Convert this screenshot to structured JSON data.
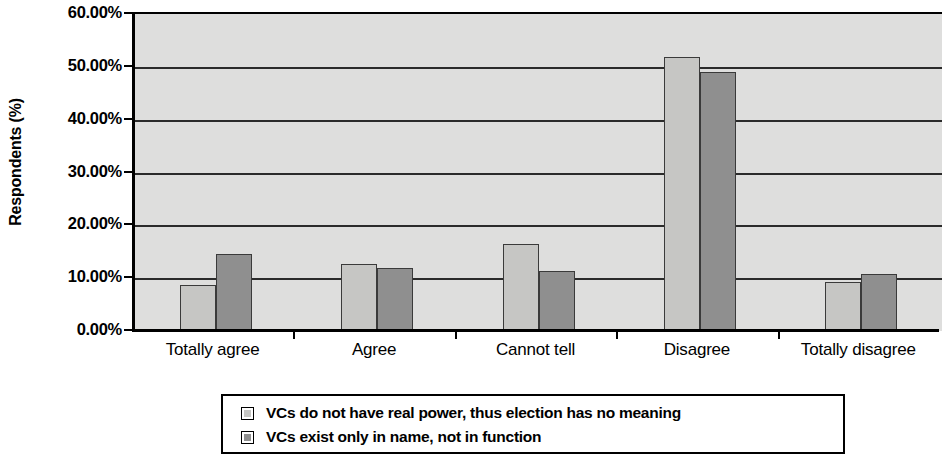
{
  "chart_data": {
    "type": "bar",
    "title": "",
    "xlabel": "",
    "ylabel": "Respondents (%)",
    "categories": [
      "Totally agree",
      "Agree",
      "Cannot tell",
      "Disagree",
      "Totally disagree"
    ],
    "series": [
      {
        "name": "VCs do not have real power, thus election has no meaning",
        "color": "#c6c6c4",
        "values": [
          8.7,
          12.7,
          16.4,
          51.8,
          9.3
        ]
      },
      {
        "name": "VCs exist only in name, not in function",
        "color": "#8f8f8f",
        "values": [
          14.6,
          12.0,
          11.4,
          49.0,
          10.7
        ]
      }
    ],
    "ylim": [
      0,
      60
    ],
    "y_ticks": [
      0,
      10,
      20,
      30,
      40,
      50,
      60
    ],
    "y_tick_labels": [
      "0.00%",
      "10.00%",
      "20.00%",
      "30.00%",
      "40.00%",
      "50.00%",
      "60.00%"
    ],
    "grid": true,
    "grid_axis": "y",
    "legend_position": "bottom",
    "plot_background": "#dededd",
    "axis_color": "#000000"
  },
  "legend": {
    "items": [
      {
        "label": "VCs do not have real power, thus election has no meaning",
        "swatch": "series0"
      },
      {
        "label": "VCs exist only in name, not in function",
        "swatch": "series1"
      }
    ]
  }
}
